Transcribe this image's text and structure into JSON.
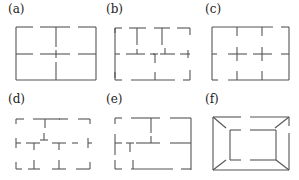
{
  "figure": {
    "panels": [
      {
        "id": "a",
        "label": "(a)",
        "label_pos": [
          8,
          3
        ]
      },
      {
        "id": "b",
        "label": "(b)",
        "label_pos": [
          107,
          3
        ]
      },
      {
        "id": "c",
        "label": "(c)",
        "label_pos": [
          205,
          3
        ]
      },
      {
        "id": "d",
        "label": "(d)",
        "label_pos": [
          8,
          92
        ]
      },
      {
        "id": "e",
        "label": "(e)",
        "label_pos": [
          107,
          92
        ]
      },
      {
        "id": "f",
        "label": "(f)",
        "label_pos": [
          205,
          92
        ]
      }
    ],
    "stroke_color": "#555555",
    "segments": {
      "a": [
        [
          16,
          27,
          16,
          80
        ],
        [
          16,
          27,
          33,
          27
        ],
        [
          40,
          27,
          70,
          27
        ],
        [
          78,
          27,
          96,
          27
        ],
        [
          96,
          27,
          96,
          80
        ],
        [
          16,
          80,
          96,
          80
        ],
        [
          56,
          27,
          56,
          47
        ],
        [
          56,
          50,
          56,
          58
        ],
        [
          56,
          62,
          56,
          80
        ],
        [
          16,
          54,
          33,
          54
        ],
        [
          40,
          54,
          70,
          54
        ],
        [
          78,
          54,
          96,
          54
        ]
      ],
      "b": [
        [
          115,
          28,
          115,
          78
        ],
        [
          115,
          28,
          122,
          28
        ],
        [
          115,
          28,
          115,
          33
        ],
        [
          129,
          28,
          146,
          28
        ],
        [
          137,
          28,
          137,
          45
        ],
        [
          154,
          28,
          170,
          28
        ],
        [
          162,
          28,
          162,
          45
        ],
        [
          177,
          28,
          190,
          28
        ],
        [
          190,
          28,
          190,
          35
        ],
        [
          115,
          54,
          120,
          54
        ],
        [
          126,
          54,
          145,
          54
        ],
        [
          137,
          49,
          137,
          54
        ],
        [
          150,
          54,
          158,
          54
        ],
        [
          153,
          54,
          155,
          54
        ],
        [
          155,
          54,
          155,
          63
        ],
        [
          160,
          54,
          175,
          54
        ],
        [
          165,
          48,
          165,
          54
        ],
        [
          180,
          54,
          190,
          54
        ],
        [
          188,
          50,
          188,
          58
        ],
        [
          115,
          72,
          115,
          80
        ],
        [
          115,
          80,
          122,
          80
        ],
        [
          131,
          80,
          175,
          80
        ],
        [
          155,
          72,
          155,
          80
        ],
        [
          183,
          80,
          190,
          80
        ],
        [
          190,
          70,
          190,
          80
        ]
      ],
      "c": [
        [
          212,
          27,
          212,
          80
        ],
        [
          212,
          27,
          273,
          27
        ],
        [
          281,
          27,
          289,
          27
        ],
        [
          289,
          27,
          289,
          80
        ],
        [
          237,
          27,
          237,
          36
        ],
        [
          262,
          27,
          262,
          36
        ],
        [
          212,
          54,
          217,
          54
        ],
        [
          228,
          54,
          247,
          54
        ],
        [
          237,
          47,
          237,
          61
        ],
        [
          253,
          54,
          272,
          54
        ],
        [
          262,
          47,
          262,
          61
        ],
        [
          281,
          54,
          289,
          54
        ],
        [
          212,
          80,
          218,
          80
        ],
        [
          228,
          80,
          289,
          80
        ],
        [
          237,
          71,
          237,
          80
        ],
        [
          262,
          71,
          262,
          80
        ]
      ],
      "d": [
        [
          16,
          119,
          16,
          124
        ],
        [
          16,
          119,
          24,
          119
        ],
        [
          33,
          119,
          52,
          119
        ],
        [
          45,
          119,
          45,
          128
        ],
        [
          59,
          119,
          68,
          119
        ],
        [
          52,
          119,
          60,
          119
        ],
        [
          78,
          119,
          90,
          119
        ],
        [
          90,
          119,
          90,
          124
        ],
        [
          16,
          138,
          16,
          148
        ],
        [
          16,
          143,
          21,
          143
        ],
        [
          26,
          143,
          40,
          143
        ],
        [
          34,
          143,
          34,
          150
        ],
        [
          40,
          140,
          48,
          140
        ],
        [
          44,
          133,
          44,
          140
        ],
        [
          52,
          143,
          66,
          143
        ],
        [
          59,
          143,
          59,
          150
        ],
        [
          72,
          143,
          78,
          143
        ],
        [
          88,
          143,
          92,
          143
        ],
        [
          88,
          138,
          88,
          148
        ],
        [
          16,
          162,
          16,
          169
        ],
        [
          16,
          169,
          22,
          169
        ],
        [
          28,
          169,
          40,
          169
        ],
        [
          34,
          160,
          34,
          169
        ],
        [
          52,
          169,
          66,
          169
        ],
        [
          59,
          160,
          59,
          169
        ],
        [
          76,
          169,
          90,
          169
        ],
        [
          90,
          162,
          90,
          169
        ]
      ],
      "e": [
        [
          115,
          118,
          115,
          124
        ],
        [
          115,
          118,
          122,
          118
        ],
        [
          131,
          118,
          160,
          118
        ],
        [
          151,
          118,
          151,
          133
        ],
        [
          170,
          118,
          191,
          118
        ],
        [
          191,
          118,
          191,
          170
        ],
        [
          115,
          134,
          115,
          155
        ],
        [
          115,
          143,
          122,
          143
        ],
        [
          126,
          143,
          134,
          143
        ],
        [
          130,
          143,
          130,
          152
        ],
        [
          136,
          143,
          160,
          143
        ],
        [
          151,
          136,
          151,
          143
        ],
        [
          170,
          143,
          191,
          143
        ],
        [
          115,
          160,
          115,
          169
        ],
        [
          115,
          169,
          122,
          169
        ],
        [
          131,
          169,
          173,
          169
        ],
        [
          133,
          160,
          133,
          169
        ],
        [
          181,
          169,
          191,
          169
        ]
      ],
      "f": [
        [
          213,
          117,
          213,
          170
        ],
        [
          213,
          117,
          241,
          117
        ],
        [
          250,
          117,
          289,
          117
        ],
        [
          289,
          117,
          289,
          126
        ],
        [
          289,
          133,
          289,
          170
        ],
        [
          213,
          170,
          289,
          170
        ],
        [
          213,
          117,
          226,
          128
        ],
        [
          289,
          117,
          275,
          128
        ],
        [
          213,
          170,
          226,
          160
        ],
        [
          289,
          170,
          276,
          160
        ],
        [
          230,
          130,
          241,
          130
        ],
        [
          250,
          130,
          276,
          130
        ],
        [
          230,
          130,
          230,
          160
        ],
        [
          276,
          130,
          276,
          160
        ],
        [
          230,
          160,
          241,
          160
        ],
        [
          250,
          160,
          276,
          160
        ]
      ]
    }
  }
}
